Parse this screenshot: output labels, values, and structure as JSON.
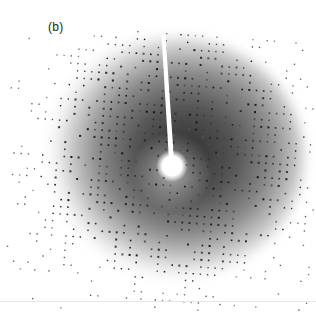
{
  "figure": {
    "panel_label": "(b)",
    "colors": {
      "background": "#ffffff",
      "halo_dark": "#3a3a3a",
      "spot": "#2a2a2a",
      "beamstop": "#ffffff"
    },
    "halo": {
      "cx": 170,
      "cy": 160,
      "rx": 122,
      "ry": 112
    },
    "beamstop": {
      "stick_top_x": 163,
      "stick_top_y": 36,
      "spot_cx": 172,
      "spot_cy": 166,
      "spot_r": 10
    },
    "lattice": {
      "spacing": 7.2,
      "rotation_deg": 4
    }
  }
}
